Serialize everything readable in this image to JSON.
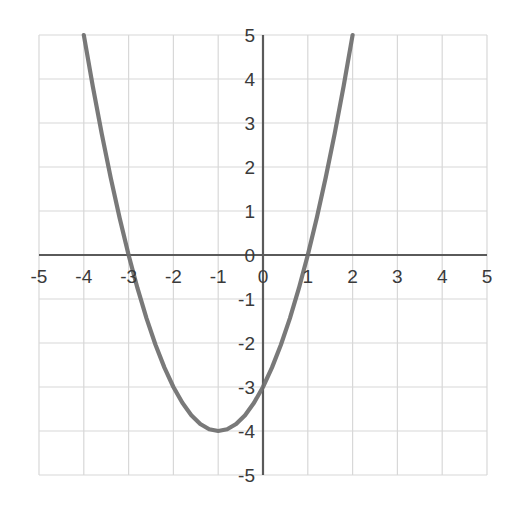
{
  "chart_data": {
    "type": "line",
    "title": "",
    "subtitle": "",
    "xlabel": "",
    "ylabel": "",
    "xlim": [
      -5,
      5
    ],
    "ylim": [
      -5,
      5
    ],
    "grid": true,
    "legend": null,
    "x_ticks": [
      "-5",
      "-4",
      "-3",
      "-2",
      "-1",
      "0",
      "1",
      "2",
      "3",
      "4",
      "5"
    ],
    "x_tick_values": [
      -5,
      -4,
      -3,
      -2,
      -1,
      0,
      1,
      2,
      3,
      4,
      5
    ],
    "y_ticks": [
      "5",
      "4",
      "3",
      "2",
      "1",
      "0",
      "-1",
      "-2",
      "-3",
      "-4",
      "-5"
    ],
    "y_tick_values": [
      5,
      4,
      3,
      2,
      1,
      0,
      -1,
      -2,
      -3,
      -4,
      -5
    ],
    "series": [
      {
        "name": "y = x^2 + 2x - 3",
        "equation": "y = x^2 + 2x - 3",
        "color": "#6e6e6e",
        "vertex": [
          -1,
          -4
        ],
        "roots": [
          -3,
          1
        ],
        "y_intercept": -3,
        "x": [
          -4.0,
          -3.8,
          -3.6,
          -3.4,
          -3.2,
          -3.0,
          -2.8,
          -2.6,
          -2.4,
          -2.2,
          -2.0,
          -1.8,
          -1.6,
          -1.4,
          -1.2,
          -1.0,
          -0.8,
          -0.6,
          -0.4,
          -0.2,
          0.0,
          0.2,
          0.4,
          0.6,
          0.8,
          1.0,
          1.2,
          1.4,
          1.6,
          1.8,
          2.0
        ],
        "values": [
          5.0,
          3.84,
          2.76,
          1.76,
          0.84,
          0.0,
          -0.76,
          -1.44,
          -2.04,
          -2.56,
          -3.0,
          -3.36,
          -3.64,
          -3.84,
          -3.96,
          -4.0,
          -3.96,
          -3.84,
          -3.64,
          -3.36,
          -3.0,
          -2.56,
          -2.04,
          -1.44,
          -0.76,
          0.0,
          0.84,
          1.76,
          2.76,
          3.84,
          5.0
        ]
      }
    ],
    "colors": {
      "curve": "#6e6e6e",
      "axis": "#5a5a5a",
      "grid": "#d8d8d8",
      "background": "#ffffff",
      "tick_text": "#3a3a3a"
    }
  },
  "axes": {
    "x_axis_name": "x-axis",
    "y_axis_name": "y-axis",
    "origin_label": "0"
  }
}
